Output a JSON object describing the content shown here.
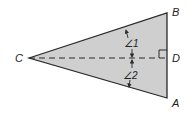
{
  "diagram": {
    "type": "geometry-triangle",
    "vertices": {
      "C": {
        "label": "C"
      },
      "B": {
        "label": "B"
      },
      "D": {
        "label": "D"
      },
      "A": {
        "label": "A"
      }
    },
    "angles": {
      "angle1": {
        "label": "∠1"
      },
      "angle2": {
        "label": "∠2"
      }
    },
    "colors": {
      "fill": "#cfcfcf",
      "stroke": "#2a2a2a",
      "text": "#222222"
    }
  }
}
